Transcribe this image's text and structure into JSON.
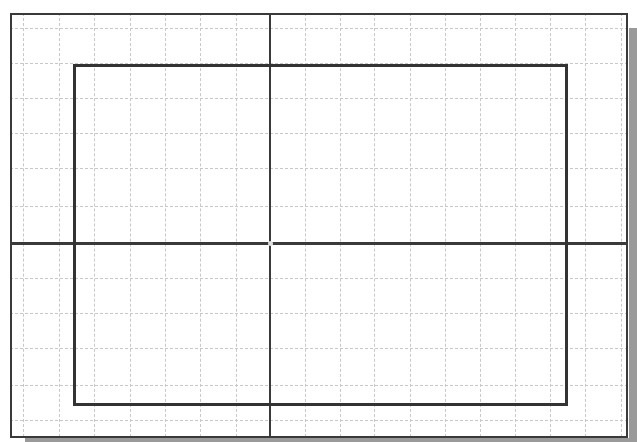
{
  "drawing": {
    "type": "cad-grid-sketch",
    "background": "#ffffff",
    "grid_color": "#c8c8c8",
    "line_color": "#333333",
    "shadow_color": "#9a9a9a",
    "frame": {
      "x": 10,
      "y": 13,
      "w": 618,
      "h": 425
    },
    "grid_vertical_x": [
      23,
      59,
      94,
      130,
      165,
      200,
      236,
      305,
      340,
      374,
      410,
      445,
      480,
      515,
      550,
      585,
      621
    ],
    "grid_horizontal_y": [
      28,
      63,
      98,
      133,
      168,
      206,
      278,
      313,
      348,
      385,
      420
    ],
    "axis_vertical_x": 269,
    "axis_horizontal_y": 242,
    "origin": {
      "x": 270,
      "y": 243
    },
    "rectangle": {
      "x": 73,
      "y": 64,
      "w": 495,
      "h": 342
    }
  }
}
